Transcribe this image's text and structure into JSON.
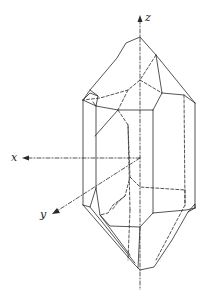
{
  "diagram": {
    "type": "crystal-morphology",
    "axes": {
      "x": {
        "label": "x"
      },
      "y": {
        "label": "y"
      },
      "z": {
        "label": "z"
      }
    },
    "colors": {
      "line": "#2a2a2a",
      "background": "#ffffff"
    }
  }
}
